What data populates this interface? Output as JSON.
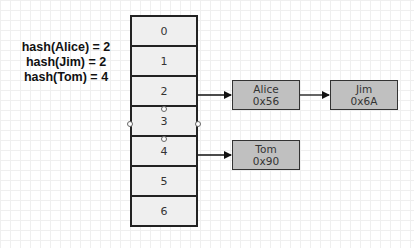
{
  "hash_labels": [
    "hash(Alice) = 2",
    "hash(Jim) = 2",
    "hash(Tom) = 4"
  ],
  "array": {
    "cells": [
      "0",
      "1",
      "2",
      "3",
      "4",
      "5",
      "6"
    ],
    "selected_index": 3
  },
  "nodes": {
    "alice": {
      "name": "Alice",
      "address": "0x56"
    },
    "jim": {
      "name": "Jim",
      "address": "0x6A"
    },
    "tom": {
      "name": "Tom",
      "address": "0x90"
    }
  },
  "edges": [
    {
      "from": "cell-2",
      "to": "alice"
    },
    {
      "from": "alice",
      "to": "jim"
    },
    {
      "from": "cell-4",
      "to": "tom"
    }
  ],
  "colors": {
    "cell_fill": "#efefef",
    "node_fill": "#c0c0c0",
    "stroke": "#222222",
    "grid": "#efefef"
  }
}
